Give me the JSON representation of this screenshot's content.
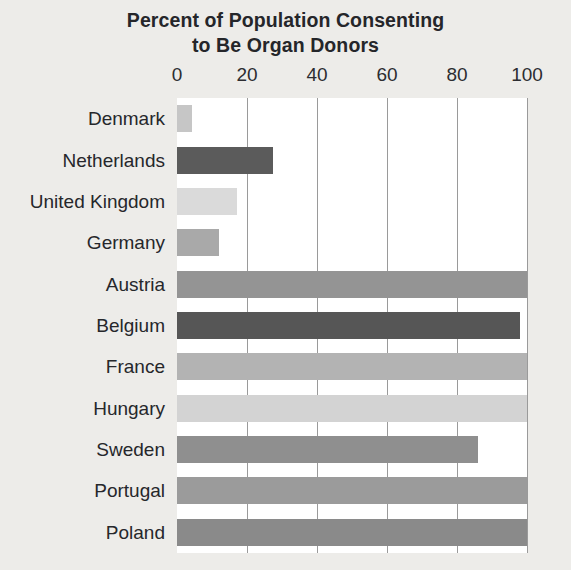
{
  "chart_data": {
    "type": "bar",
    "orientation": "horizontal",
    "title": "Percent of Population Consenting to Be Organ Donors",
    "title_lines": [
      "Percent of Population Consenting",
      "to Be Organ Donors"
    ],
    "xlabel": "",
    "ylabel": "",
    "xlim": [
      0,
      100
    ],
    "xticks": [
      0,
      20,
      40,
      60,
      80,
      100
    ],
    "xtick_labels": [
      "0",
      "20",
      "40",
      "60",
      "80",
      "100"
    ],
    "grid": "vertical",
    "legend": "none",
    "categories": [
      "Denmark",
      "Netherlands",
      "United Kingdom",
      "Germany",
      "Austria",
      "Belgium",
      "France",
      "Hungary",
      "Sweden",
      "Portugal",
      "Poland"
    ],
    "values": [
      4.3,
      27.5,
      17.2,
      12,
      99.9,
      98,
      99.9,
      99.9,
      85.9,
      99.9,
      99.9
    ],
    "bar_colors": [
      "#c6c6c6",
      "#5b5b5b",
      "#dadada",
      "#a9a9a9",
      "#949494",
      "#565656",
      "#b3b3b3",
      "#d3d3d3",
      "#8f8f8f",
      "#9b9b9b",
      "#8a8a8a"
    ],
    "plot_background": "#ffffff",
    "figure_background": "#edece9",
    "gridline_color": "#9a9a9a",
    "text_color": "#26272b"
  }
}
